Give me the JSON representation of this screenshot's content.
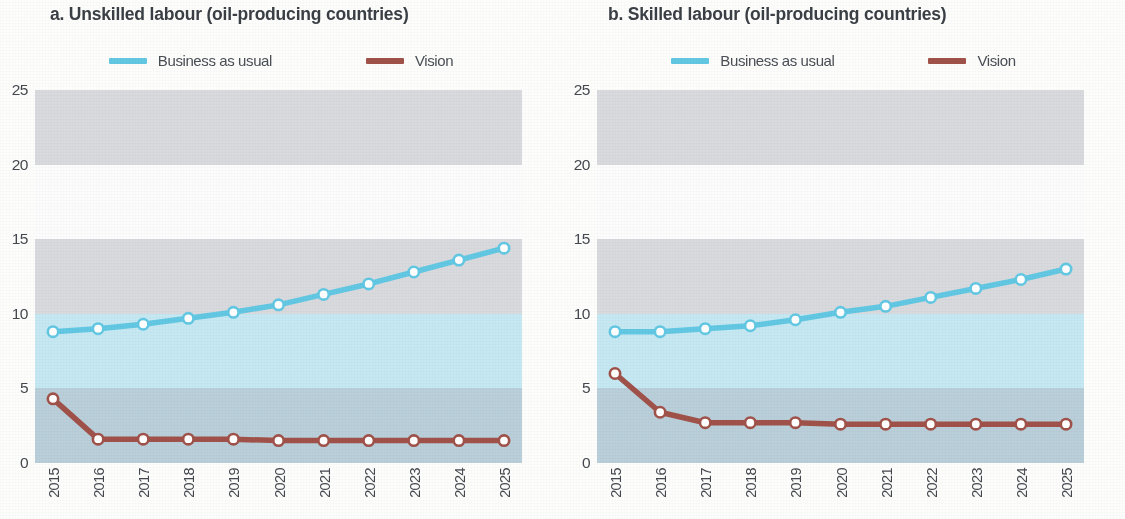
{
  "figure": {
    "panels": [
      {
        "key": "a",
        "title": "a. Unskilled labour (oil-producing countries)",
        "legend": [
          {
            "label": "Business as usual",
            "color": "#62c8e3",
            "name": "business-as-usual"
          },
          {
            "label": "Vision",
            "color": "#a0524a",
            "name": "vision"
          }
        ]
      },
      {
        "key": "b",
        "title": "b. Skilled labour (oil-producing countries)",
        "legend": [
          {
            "label": "Business as usual",
            "color": "#62c8e3",
            "name": "business-as-usual"
          },
          {
            "label": "Vision",
            "color": "#a0524a",
            "name": "vision"
          }
        ]
      }
    ]
  },
  "colors": {
    "blue_line": "#62c8e3",
    "red_line": "#a0524a",
    "marker_fill": "#ffffff",
    "band_gray": "#d9dade",
    "band_white": "#fcfcfc",
    "band_cyan": "#c5e8f2",
    "band_bluegray": "#b9cfd9",
    "axis_text": "#45494f",
    "title_text": "#3a3f45"
  },
  "chart_data": [
    {
      "type": "line",
      "panel": "a",
      "title": "a. Unskilled labour (oil-producing countries)",
      "xlabel": "",
      "ylabel": "",
      "ylim": [
        0,
        25
      ],
      "yticks": [
        0,
        5,
        10,
        15,
        20,
        25
      ],
      "grid": false,
      "legend_position": "top-center",
      "categories": [
        "2015",
        "2016",
        "2017",
        "2018",
        "2019",
        "2020",
        "2021",
        "2022",
        "2023",
        "2024",
        "2025"
      ],
      "series": [
        {
          "name": "Business as usual",
          "color": "#62c8e3",
          "values": [
            8.8,
            9.0,
            9.3,
            9.7,
            10.1,
            10.6,
            11.3,
            12.0,
            12.8,
            13.6,
            14.4
          ]
        },
        {
          "name": "Vision",
          "color": "#a0524a",
          "values": [
            4.3,
            1.6,
            1.6,
            1.6,
            1.6,
            1.5,
            1.5,
            1.5,
            1.5,
            1.5,
            1.5
          ]
        }
      ]
    },
    {
      "type": "line",
      "panel": "b",
      "title": "b. Skilled labour (oil-producing countries)",
      "xlabel": "",
      "ylabel": "",
      "ylim": [
        0,
        25
      ],
      "yticks": [
        0,
        5,
        10,
        15,
        20,
        25
      ],
      "grid": false,
      "legend_position": "top-center",
      "categories": [
        "2015",
        "2016",
        "2017",
        "2018",
        "2019",
        "2020",
        "2021",
        "2022",
        "2023",
        "2024",
        "2025"
      ],
      "series": [
        {
          "name": "Business as usual",
          "color": "#62c8e3",
          "values": [
            8.8,
            8.8,
            9.0,
            9.2,
            9.6,
            10.1,
            10.5,
            11.1,
            11.7,
            12.3,
            13.0
          ]
        },
        {
          "name": "Vision",
          "color": "#a0524a",
          "values": [
            6.0,
            3.4,
            2.7,
            2.7,
            2.7,
            2.6,
            2.6,
            2.6,
            2.6,
            2.6,
            2.6
          ]
        }
      ]
    }
  ],
  "bands": [
    {
      "from": 20,
      "to": 25,
      "color": "#d9dade",
      "name": "band-20-25"
    },
    {
      "from": 15,
      "to": 20,
      "color": "#fcfcfc",
      "name": "band-15-20"
    },
    {
      "from": 10,
      "to": 15,
      "color": "#d9dade",
      "name": "band-10-15"
    },
    {
      "from": 5,
      "to": 10,
      "color": "#c5e8f2",
      "name": "band-5-10"
    },
    {
      "from": 0,
      "to": 5,
      "color": "#b9cfd9",
      "name": "band-0-5"
    }
  ]
}
